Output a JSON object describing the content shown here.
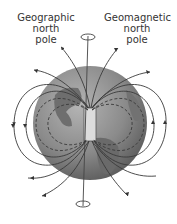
{
  "labels": {
    "geographic_north_pole": "Geographic north pole",
    "geographic_line1": "Geographic",
    "geographic_line2": "north",
    "geographic_line3": "pole",
    "geomagnetic_line1": "Geomagnetic",
    "geomagnetic_line2": "north",
    "geomagnetic_line3": "pole"
  },
  "colors": {
    "globe": "#8a8a8a",
    "land": "#6c6c6c",
    "magnet": "#d8d8d8",
    "field_lines": "#444444"
  }
}
